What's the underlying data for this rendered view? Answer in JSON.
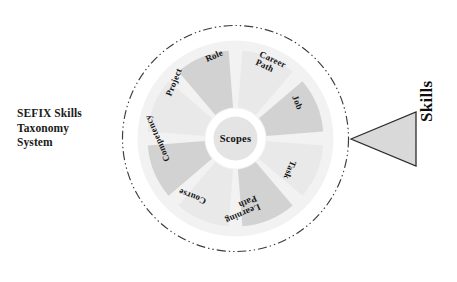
{
  "diagram": {
    "title": "SEFIX Skills Taxonomy System",
    "caption_lines": [
      "SEFIX Skills",
      "Taxonomy",
      "System"
    ],
    "hub_label": "Scopes",
    "arrow_label": "Skills",
    "colors": {
      "background": "#ffffff",
      "outer_boundary": "#3c3c3c",
      "disc_fill": "#f2f2f2",
      "wedge_light": "#e9e9e9",
      "wedge_dark": "#d2d2d2",
      "hub_fill": "#e4e4e4",
      "hub_ring": "#ffffff",
      "arrow_fill": "#d9d9d9",
      "arrow_stroke": "#2b2b2b",
      "text": "#141414"
    },
    "geometry": {
      "center_x": 124.5,
      "center_y": 124.5,
      "boundary_radius": 113,
      "disc_radius": 98,
      "wedge_outer_radius": 88,
      "wedge_inner_radius": 31,
      "hub_ring_radius": 30,
      "hub_radius": 22,
      "wedge_gap_degrees": 9
    },
    "sectors": [
      {
        "label": "Career Path",
        "lines": [
          "Career",
          "Path"
        ],
        "shade": "light",
        "mid_angle": -67.5,
        "label_x": 147,
        "label_y": 44,
        "label_rotation": 25
      },
      {
        "label": "Job",
        "lines": [
          "Job"
        ],
        "shade": "dark",
        "mid_angle": -22.5,
        "label_x": 183,
        "label_y": 82,
        "label_rotation": 68
      },
      {
        "label": "Task",
        "lines": [
          "Task"
        ],
        "shade": "light",
        "mid_angle": 22.5,
        "label_x": 182,
        "label_y": 147,
        "label_rotation": 113
      },
      {
        "label": "Learning Path",
        "lines": [
          "Learning",
          "Path"
        ],
        "shade": "dark",
        "mid_angle": 67.5,
        "label_x": 147,
        "label_y": 188,
        "label_rotation": 157
      },
      {
        "label": "Course",
        "lines": [
          "Course"
        ],
        "shade": "light",
        "mid_angle": 112.5,
        "label_x": 95,
        "label_y": 187,
        "label_rotation": 201
      },
      {
        "label": "Competency",
        "lines": [
          "Competency"
        ],
        "shade": "dark",
        "mid_angle": 157.5,
        "label_x": 57,
        "label_y": 147,
        "label_rotation": 246
      },
      {
        "label": "Project",
        "lines": [
          "Project"
        ],
        "shade": "light",
        "mid_angle": -157.5,
        "label_x": 58,
        "label_y": 82,
        "label_rotation": 292
      },
      {
        "label": "Role",
        "lines": [
          "Role"
        ],
        "shade": "dark",
        "mid_angle": -112.5,
        "label_x": 95,
        "label_y": 46,
        "label_rotation": 337
      }
    ]
  }
}
